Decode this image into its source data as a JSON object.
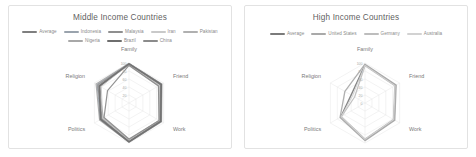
{
  "charts": [
    {
      "title": "Middle Income Countries",
      "legend": [
        {
          "label": "Average",
          "color": "#7f7f7f"
        },
        {
          "label": "Indonesia",
          "color": "#9aa3ad"
        },
        {
          "label": "Malaysia",
          "color": "#8f8f8f"
        },
        {
          "label": "Iran",
          "color": "#c9c9c9"
        },
        {
          "label": "Pakistan",
          "color": "#b0b0b0"
        },
        {
          "label": "Nigeria",
          "color": "#a8a8a8"
        },
        {
          "label": "Brazil",
          "color": "#6e6e6e"
        },
        {
          "label": "China",
          "color": "#8b8b8b"
        }
      ]
    },
    {
      "title": "High Income Countries",
      "legend": [
        {
          "label": "Average",
          "color": "#7b7b7b"
        },
        {
          "label": "United States",
          "color": "#a9a9a9"
        },
        {
          "label": "Germany",
          "color": "#bdbdbd"
        },
        {
          "label": "Australia",
          "color": "#d2d2d2"
        }
      ]
    }
  ],
  "chart_data": [
    {
      "type": "radar",
      "title": "Middle Income Countries",
      "categories": [
        "Family",
        "Friend",
        "Work",
        "Leisure Time",
        "Politics",
        "Religion"
      ],
      "tick_labels": [
        "100",
        "80",
        "60",
        "40",
        "20"
      ],
      "rlim": [
        0,
        100
      ],
      "rings": 5,
      "grid": true,
      "legend_position": "top",
      "series": [
        {
          "name": "Average",
          "color": "#7f7f7f",
          "width": 1.5,
          "values": [
            98,
            92,
            90,
            96,
            80,
            84
          ]
        },
        {
          "name": "Indonesia",
          "color": "#9aa3ad",
          "width": 1.2,
          "values": [
            99,
            94,
            93,
            97,
            83,
            92
          ]
        },
        {
          "name": "Malaysia",
          "color": "#8f8f8f",
          "width": 1.2,
          "values": [
            97,
            90,
            91,
            95,
            78,
            90
          ]
        },
        {
          "name": "Iran",
          "color": "#c9c9c9",
          "width": 1.0,
          "values": [
            96,
            88,
            86,
            93,
            76,
            80
          ]
        },
        {
          "name": "Pakistan",
          "color": "#b0b0b0",
          "width": 1.2,
          "values": [
            95,
            86,
            88,
            92,
            74,
            88
          ]
        },
        {
          "name": "Nigeria",
          "color": "#a8a8a8",
          "width": 1.2,
          "values": [
            99,
            95,
            94,
            98,
            85,
            95
          ]
        },
        {
          "name": "Brazil",
          "color": "#6e6e6e",
          "width": 1.6,
          "values": [
            98,
            93,
            92,
            97,
            82,
            86
          ]
        },
        {
          "name": "China",
          "color": "#8b8b8b",
          "width": 1.2,
          "values": [
            94,
            85,
            87,
            90,
            72,
            62
          ]
        }
      ]
    },
    {
      "type": "radar",
      "title": "High Income Countries",
      "categories": [
        "Family",
        "Friend",
        "Work",
        "Leisure Time",
        "Politics",
        "Religion"
      ],
      "tick_labels": [
        "100",
        "80",
        "60",
        "40",
        "20",
        "0"
      ],
      "rlim": [
        0,
        100
      ],
      "rings": 5,
      "grid": true,
      "legend_position": "top",
      "series": [
        {
          "name": "Average",
          "color": "#7b7b7b",
          "width": 1.5,
          "values": [
            95,
            88,
            84,
            92,
            70,
            40
          ]
        },
        {
          "name": "United States",
          "color": "#a9a9a9",
          "width": 1.3,
          "values": [
            97,
            90,
            86,
            94,
            72,
            58
          ]
        },
        {
          "name": "Germany",
          "color": "#bdbdbd",
          "width": 1.2,
          "values": [
            93,
            86,
            82,
            90,
            68,
            30
          ]
        },
        {
          "name": "Australia",
          "color": "#d2d2d2",
          "width": 1.1,
          "values": [
            94,
            87,
            83,
            91,
            69,
            36
          ]
        }
      ]
    }
  ]
}
